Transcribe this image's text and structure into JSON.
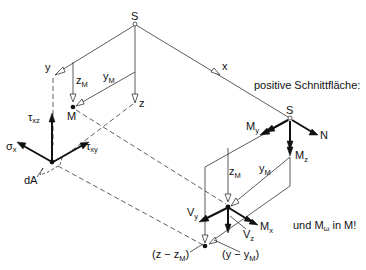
{
  "diagram": {
    "title": "",
    "language": "de",
    "labels": {
      "s_top": "S",
      "y_axis": "y",
      "z_axis": "z",
      "x_axis": "x",
      "zM_top": "z",
      "zM_top_sub": "M",
      "yM_top": "y",
      "yM_top_sub": "M",
      "M_top": "M",
      "tau_xz": "τ",
      "tau_xz_sub": "xz",
      "sigma_x": "σ",
      "sigma_x_sub": "x",
      "tau_xy": "τ",
      "tau_xy_sub": "xy",
      "dA": "dA",
      "positive_section": "positive Schnittfläche:",
      "s_right": "S",
      "My": "M",
      "My_sub": "y",
      "N": "N",
      "Mz": "M",
      "Mz_sub": "z",
      "zM_low": "z",
      "zM_low_sub": "M",
      "yM_low": "y",
      "yM_low_sub": "M",
      "Vy": "V",
      "Vy_sub": "y",
      "Mx": "M",
      "Mx_sub": "x",
      "Vz": "V",
      "Vz_sub": "z",
      "warping_note_pre": "und M",
      "warping_note_sub": "ω",
      "warping_note_post": " in M!",
      "z_minus_zM_pre": "(z − z",
      "z_minus_zM_sub": "M",
      "z_minus_zM_post": ")",
      "y_minus_yM_pre": "(y − y",
      "y_minus_yM_sub": "M",
      "y_minus_yM_post": ")"
    },
    "nodes": {
      "S_centroid_top": [
        135,
        24
      ],
      "M_shear_center_top": [
        73,
        107
      ],
      "dA_point": [
        52,
        162
      ],
      "S_centroid_section": [
        290,
        118
      ],
      "M_shear_center_section": [
        228,
        207
      ],
      "fibre_point_section": [
        205,
        246
      ]
    },
    "colors": {
      "line": "#333333",
      "arrow": "#111111",
      "background": "#ffffff"
    }
  }
}
